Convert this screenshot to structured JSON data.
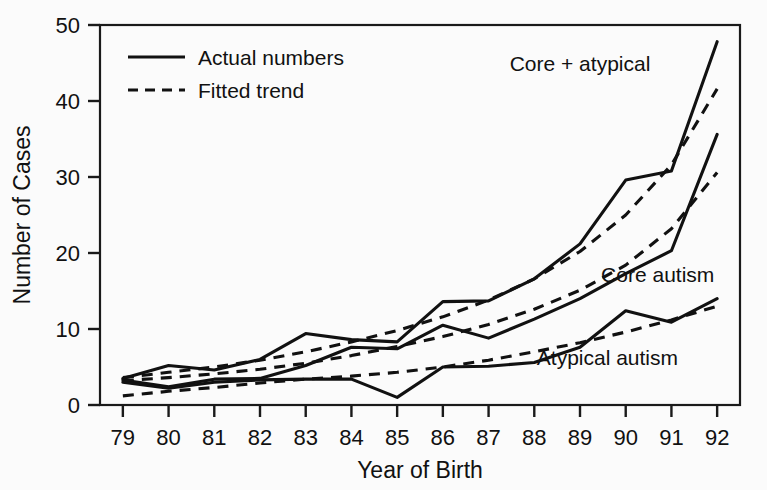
{
  "chart_data": {
    "type": "line",
    "title": "",
    "xlabel": "Year of Birth",
    "ylabel": "Number of Cases",
    "x": [
      79,
      80,
      81,
      82,
      83,
      84,
      85,
      86,
      87,
      88,
      89,
      90,
      91,
      92
    ],
    "categories": [
      "79",
      "80",
      "81",
      "82",
      "83",
      "84",
      "85",
      "86",
      "87",
      "88",
      "89",
      "90",
      "91",
      "92"
    ],
    "xtick_labels": [
      "79",
      "80",
      "81",
      "82",
      "83",
      "84",
      "85",
      "86",
      "87",
      "88",
      "89",
      "90",
      "91",
      "92"
    ],
    "ytick_labels": [
      "0",
      "10",
      "20",
      "30",
      "40",
      "50"
    ],
    "yticks": [
      0,
      10,
      20,
      30,
      40,
      50
    ],
    "xlim": [
      78.5,
      92.5
    ],
    "ylim": [
      0,
      50
    ],
    "grid": false,
    "legend_position": "top-left inside axes",
    "series": [
      {
        "name": "Core + atypical",
        "style": "solid",
        "legend_group": "Actual numbers",
        "values": [
          3.5,
          5.2,
          4.6,
          6.0,
          9.4,
          8.6,
          8.3,
          13.6,
          13.7,
          16.6,
          21.2,
          29.6,
          30.8,
          47.8
        ]
      },
      {
        "name": "Core + atypical (fitted)",
        "style": "dashed",
        "legend_group": "Fitted trend",
        "values": [
          3.6,
          4.3,
          5.0,
          5.9,
          7.0,
          8.3,
          9.8,
          11.6,
          13.8,
          16.6,
          20.2,
          25.0,
          31.6,
          41.6
        ]
      },
      {
        "name": "Core autism",
        "style": "solid",
        "legend_group": "Actual numbers",
        "values": [
          3.3,
          2.4,
          3.4,
          3.5,
          5.2,
          7.6,
          7.4,
          10.5,
          8.8,
          11.3,
          14.0,
          17.3,
          20.3,
          35.6
        ]
      },
      {
        "name": "Core autism (fitted)",
        "style": "dashed",
        "legend_group": "Fitted trend",
        "values": [
          3.2,
          3.6,
          4.1,
          4.7,
          5.5,
          6.5,
          7.7,
          9.0,
          10.6,
          12.6,
          15.1,
          18.4,
          23.2,
          30.6
        ]
      },
      {
        "name": "Atypical autism",
        "style": "solid",
        "legend_group": "Actual numbers",
        "values": [
          3.0,
          2.2,
          3.0,
          3.3,
          3.4,
          3.4,
          1.0,
          5.0,
          5.1,
          5.6,
          7.6,
          12.4,
          10.9,
          14.0
        ]
      },
      {
        "name": "Atypical autism (fitted)",
        "style": "dashed",
        "legend_group": "Fitted trend",
        "values": [
          1.2,
          1.8,
          2.3,
          2.9,
          3.4,
          3.8,
          4.3,
          5.0,
          5.9,
          7.0,
          8.2,
          9.6,
          11.2,
          13.0
        ]
      }
    ],
    "legend": [
      {
        "label": "Actual numbers",
        "style": "solid"
      },
      {
        "label": "Fitted trend",
        "style": "dashed"
      }
    ],
    "annotations": [
      {
        "text": "Core + atypical",
        "x": 89.0,
        "y": 44.0
      },
      {
        "text": "Core autism",
        "x": 90.7,
        "y": 16.2
      },
      {
        "text": "Atypical autism",
        "x": 89.6,
        "y": 5.3
      }
    ]
  },
  "colors": {
    "line": "#111111",
    "axis": "#1a1a1a",
    "background": "#fbfbfb"
  }
}
